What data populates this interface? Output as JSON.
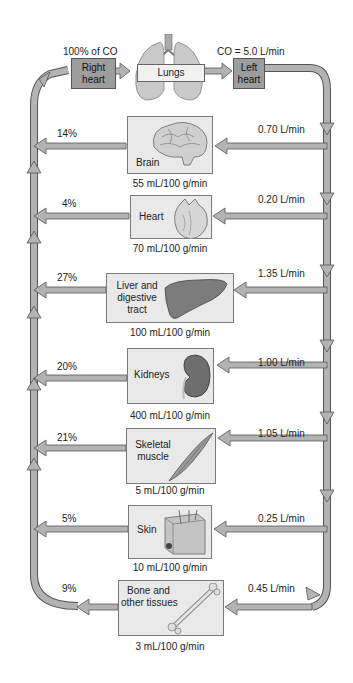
{
  "diagram": {
    "top": {
      "right_heart_caption": "100% of CO",
      "right_heart_label": "Right heart",
      "lungs_label": "Lungs",
      "left_heart_caption": "CO = 5.0 L/min",
      "left_heart_label": "Left heart"
    },
    "organs": [
      {
        "name": "Brain",
        "flow": "0.70 L/min",
        "percent": "14%",
        "perfusion": "55 mL/100 g/min",
        "icon": "brain-icon"
      },
      {
        "name": "Heart",
        "flow": "0.20 L/min",
        "percent": "4%",
        "perfusion": "70 mL/100 g/min",
        "icon": "heart-icon"
      },
      {
        "name": "Liver and digestive tract",
        "flow": "1.35 L/min",
        "percent": "27%",
        "perfusion": "100 mL/100 g/min",
        "icon": "liver-icon"
      },
      {
        "name": "Kidneys",
        "flow": "1.00 L/min",
        "percent": "20%",
        "perfusion": "400 mL/100 g/min",
        "icon": "kidney-icon"
      },
      {
        "name": "Skeletal muscle",
        "flow": "1.05 L/min",
        "percent": "21%",
        "perfusion": "5 mL/100 g/min",
        "icon": "muscle-icon"
      },
      {
        "name": "Skin",
        "flow": "0.25 L/min",
        "percent": "5%",
        "perfusion": "10 mL/100 g/min",
        "icon": "skin-icon"
      },
      {
        "name": "Bone and other tissues",
        "flow": "0.45 L/min",
        "percent": "9%",
        "perfusion": "3 mL/100 g/min",
        "icon": "bone-icon"
      }
    ],
    "label_lines": {
      "right_heart": [
        "Right",
        "heart"
      ],
      "left_heart": [
        "Left",
        "heart"
      ],
      "liver": [
        "Liver and",
        "digestive",
        "tract"
      ],
      "muscle": [
        "Skeletal",
        "muscle"
      ],
      "bone": [
        "Bone and",
        "other tissues"
      ]
    },
    "colors": {
      "arrow_fill": "#b3b3b3",
      "arrow_stroke": "#555555",
      "box_fill": "#e9e9e9",
      "heart_box_fill": "#9d9d9d"
    }
  }
}
